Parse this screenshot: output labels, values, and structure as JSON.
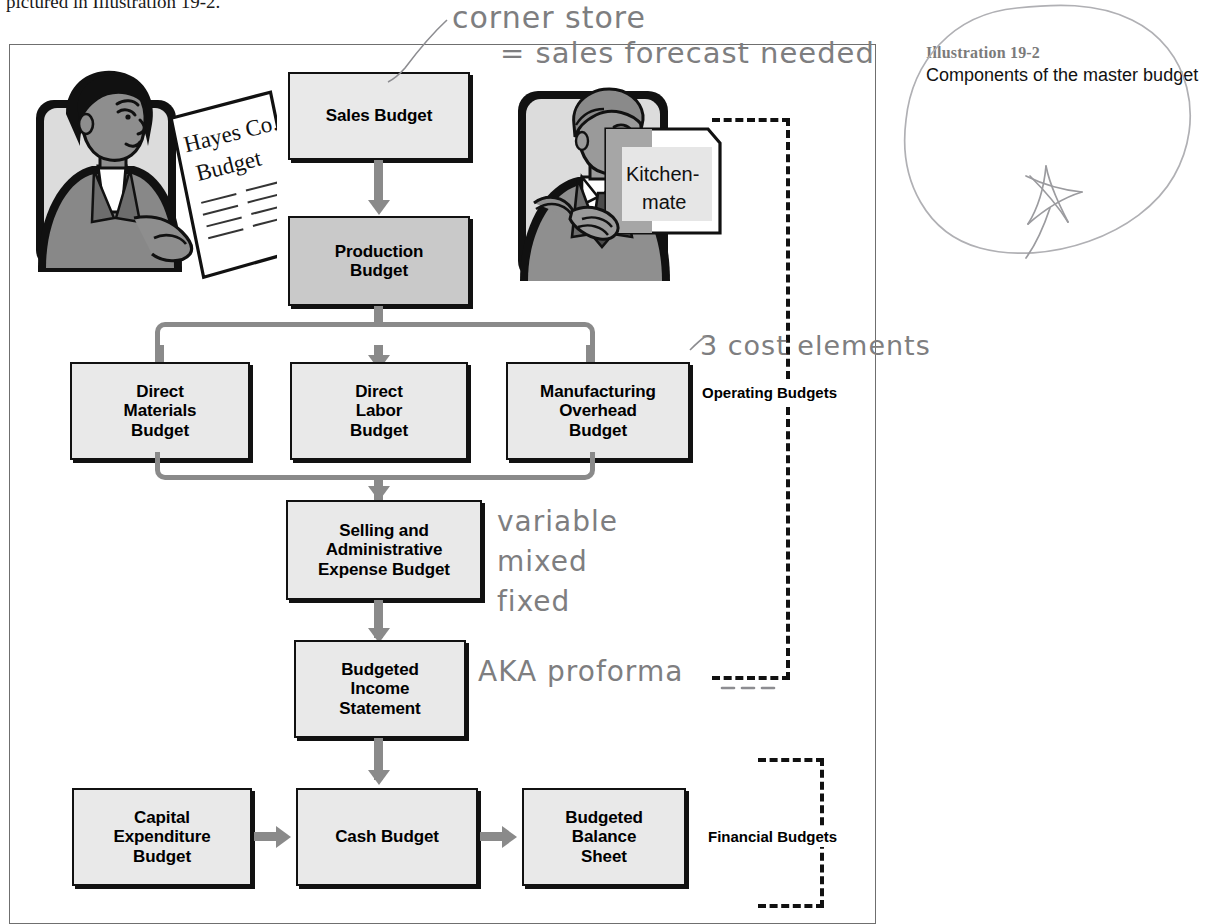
{
  "page": {
    "cutoff_text": "pictured in Illustration 19-2."
  },
  "caption": {
    "label": "Illustration 19-2",
    "title": "Components of the master budget"
  },
  "flow": {
    "boxes": [
      {
        "id": "sales",
        "label": "Sales Budget",
        "shade": "light"
      },
      {
        "id": "production",
        "label": "Production\nBudget",
        "shade": "dark"
      },
      {
        "id": "direct-materials",
        "label": "Direct\nMaterials\nBudget",
        "shade": "light"
      },
      {
        "id": "direct-labor",
        "label": "Direct\nLabor\nBudget",
        "shade": "light"
      },
      {
        "id": "mfg-overhead",
        "label": "Manufacturing\nOverhead\nBudget",
        "shade": "light"
      },
      {
        "id": "selling-admin",
        "label": "Selling and\nAdministrative\nExpense Budget",
        "shade": "light"
      },
      {
        "id": "income-statement",
        "label": "Budgeted\nIncome\nStatement",
        "shade": "light"
      },
      {
        "id": "capital-expenditure",
        "label": "Capital\nExpenditure\nBudget",
        "shade": "light"
      },
      {
        "id": "cash",
        "label": "Cash Budget",
        "shade": "light"
      },
      {
        "id": "balance-sheet",
        "label": "Budgeted\nBalance\nSheet",
        "shade": "light"
      }
    ],
    "groups": [
      {
        "id": "operating",
        "label": "Operating Budgets"
      },
      {
        "id": "financial",
        "label": "Financial Budgets"
      }
    ]
  },
  "clipart": {
    "woman_paper_line1": "Hayes Co.",
    "woman_paper_line2": "Budget",
    "man_box_line1": "Kitchen-",
    "man_box_line2": "mate"
  },
  "annotations": [
    {
      "id": "corner-store",
      "text": "corner store"
    },
    {
      "id": "sales-forecast",
      "text": "= sales forecast needed"
    },
    {
      "id": "cost-elements",
      "text": "3 cost elements"
    },
    {
      "id": "cost-behavior-1",
      "text": "variable"
    },
    {
      "id": "cost-behavior-2",
      "text": "mixed"
    },
    {
      "id": "cost-behavior-3",
      "text": "fixed"
    },
    {
      "id": "proforma",
      "text": "AKA proforma"
    }
  ],
  "colors": {
    "box_fill_light": "#e9e9e9",
    "box_fill_dark": "#c9c9c9",
    "box_border": "#111111",
    "arrow": "#8a8a8a",
    "frame": "#6f6f6f",
    "caption_label": "#7b7b7b",
    "handwriting": "#7e7e80"
  }
}
